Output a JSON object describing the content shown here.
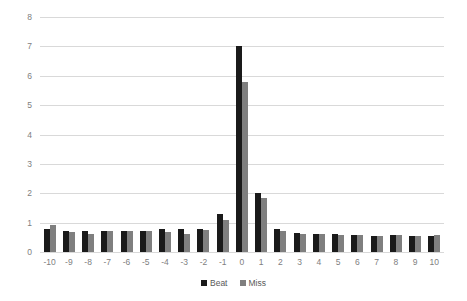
{
  "chart_data": {
    "type": "bar",
    "title": "",
    "subtitle": "",
    "xlabel": "",
    "ylabel": "",
    "ylim": [
      0,
      8
    ],
    "yticks": [
      "0",
      "1",
      "2",
      "3",
      "4",
      "5",
      "6",
      "7",
      "8"
    ],
    "grid": "horizontal",
    "legend_position": "bottom-center",
    "categories": [
      "-10",
      "-9",
      "-8",
      "-7",
      "-6",
      "-5",
      "-4",
      "-3",
      "-2",
      "-1",
      "0",
      "1",
      "2",
      "3",
      "4",
      "5",
      "6",
      "7",
      "8",
      "9",
      "10"
    ],
    "series": [
      {
        "name": "Beat",
        "color": "#1a1a1a",
        "values": [
          0.8,
          0.72,
          0.7,
          0.72,
          0.7,
          0.73,
          0.77,
          0.77,
          0.77,
          1.3,
          7.0,
          2.0,
          0.78,
          0.65,
          0.62,
          0.6,
          0.58,
          0.55,
          0.58,
          0.55,
          0.55
        ]
      },
      {
        "name": "Miss",
        "color": "#7f7f7f",
        "values": [
          0.92,
          0.67,
          0.62,
          0.7,
          0.7,
          0.7,
          0.68,
          0.62,
          0.75,
          1.1,
          5.8,
          1.85,
          0.72,
          0.62,
          0.6,
          0.58,
          0.57,
          0.55,
          0.57,
          0.55,
          0.58
        ]
      }
    ]
  },
  "legend": {
    "items": [
      {
        "label": "Beat",
        "color": "#1a1a1a"
      },
      {
        "label": "Miss",
        "color": "#7f7f7f"
      }
    ]
  },
  "style": {
    "background": "#ffffff",
    "gridline_color": "#d9d9d9",
    "tick_text_color": "#808080",
    "legend_text_color": "#595959"
  }
}
